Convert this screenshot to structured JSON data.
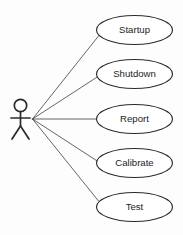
{
  "diagram": {
    "type": "uml-use-case-diagram",
    "background_color": "#fdfdfd",
    "stroke_color": "#2b2b2b",
    "line_color": "#4a4a4a",
    "label_color": "#1c1c1c",
    "actor": {
      "name": "actor",
      "label": "",
      "head_cx": 20.5,
      "head_cy": 105.5,
      "head_r": 6.2,
      "body_top_y": 111.7,
      "body_bottom_y": 126,
      "arms_y": 118,
      "arm_left_x": 11,
      "arm_right_x": 30,
      "leg_left_x": 12,
      "leg_right_x": 29,
      "leg_bottom_y": 139
    },
    "hub": {
      "x": 32.5,
      "y": 119
    },
    "ellipse": {
      "rx": 38,
      "ry": 14.5,
      "cx": 134.5
    },
    "use_cases": [
      {
        "id": "startup",
        "label": "Startup",
        "cx": 134.5,
        "cy": 30,
        "rx": 38,
        "ry": 14.5,
        "connect_x": 98.5,
        "connect_y": 36
      },
      {
        "id": "shutdown",
        "label": "Shutdown",
        "cx": 134.5,
        "cy": 74,
        "rx": 38,
        "ry": 14.5,
        "connect_x": 97.2,
        "connect_y": 77
      },
      {
        "id": "report",
        "label": "Report",
        "cx": 134.5,
        "cy": 119,
        "rx": 38,
        "ry": 14.5,
        "connect_x": 96.5,
        "connect_y": 119
      },
      {
        "id": "calibrate",
        "label": "Calibrate",
        "cx": 134.5,
        "cy": 163,
        "rx": 38,
        "ry": 14.5,
        "connect_x": 97.2,
        "connect_y": 161
      },
      {
        "id": "test",
        "label": "Test",
        "cx": 134.5,
        "cy": 207,
        "rx": 38,
        "ry": 14.5,
        "connect_x": 98.5,
        "connect_y": 201
      }
    ]
  }
}
